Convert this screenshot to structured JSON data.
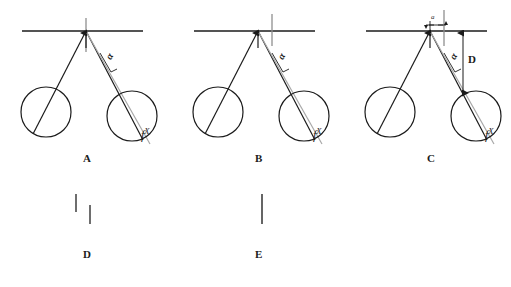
{
  "figure": {
    "background_color": "#ffffff",
    "stroke_color": "#1b1b1b",
    "gray_stroke_color": "#9a9a9a",
    "panels": [
      {
        "id": "A",
        "label": "A",
        "label_x": 86,
        "label_y": 158,
        "origin_x": 0,
        "bar": {
          "x1": 22,
          "x2": 143,
          "y": 31
        },
        "pivot": {
          "x": 86,
          "y": 31
        },
        "vertical_ref": {
          "x": 86,
          "y_top": 18,
          "y_bottom": 52
        },
        "pivot_arrow": {
          "x": 86,
          "y_tail": 48,
          "y_head": 33
        },
        "left_bob": {
          "cx": 46,
          "cy": 112,
          "r": 25
        },
        "right_bob": {
          "cx": 132,
          "cy": 116,
          "r": 25
        },
        "left_string": {
          "x1": 86,
          "y1": 31,
          "x2": 33,
          "y2": 134
        },
        "right_string_black": {
          "x1": 86,
          "y1": 31,
          "x2": 143,
          "y2": 140
        },
        "right_string_gray": {
          "x1": 86,
          "y1": 32,
          "x2": 150,
          "y2": 144
        },
        "alpha": {
          "x": 104,
          "y": 57,
          "text": "α",
          "rotation": -62
        },
        "alpha_bracket": [
          {
            "x1": 100,
            "y1": 53,
            "x2": 111,
            "y2": 72
          },
          {
            "x1": 111,
            "y1": 72,
            "x2": 117,
            "y2": 69
          }
        ],
        "fx": {
          "x": 141,
          "y": 130,
          "base": "f",
          "sup": "X"
        },
        "has_d_dimension": false,
        "has_a_dimension": false
      },
      {
        "id": "B",
        "label": "B",
        "label_x": 258,
        "label_y": 158,
        "origin_x": 172,
        "bar": {
          "x1": 194,
          "x2": 315,
          "y": 31
        },
        "pivot": {
          "x": 258,
          "y": 31
        },
        "vertical_ref": {
          "x": 272,
          "y_top": 18,
          "y_bottom": 46
        },
        "pivot_arrow": {
          "x": 258,
          "y_tail": 48,
          "y_head": 33
        },
        "left_bob": {
          "cx": 218,
          "cy": 112,
          "r": 25
        },
        "right_bob": {
          "cx": 304,
          "cy": 116,
          "r": 25
        },
        "left_string": {
          "x1": 258,
          "y1": 31,
          "x2": 205,
          "y2": 134
        },
        "right_string_black": {
          "x1": 258,
          "y1": 31,
          "x2": 315,
          "y2": 140
        },
        "right_string_gray": {
          "x1": 258,
          "y1": 32,
          "x2": 322,
          "y2": 144
        },
        "alpha": {
          "x": 276,
          "y": 57,
          "text": "α",
          "rotation": -62
        },
        "alpha_bracket": [
          {
            "x1": 272,
            "y1": 53,
            "x2": 283,
            "y2": 72
          },
          {
            "x1": 283,
            "y1": 72,
            "x2": 289,
            "y2": 69
          }
        ],
        "fx": {
          "x": 313,
          "y": 130,
          "base": "f",
          "sup": "X"
        },
        "has_d_dimension": false,
        "has_a_dimension": false
      },
      {
        "id": "C",
        "label": "C",
        "label_x": 430,
        "label_y": 158,
        "origin_x": 344,
        "bar": {
          "x1": 366,
          "x2": 487,
          "y": 31
        },
        "pivot": {
          "x": 430,
          "y": 31
        },
        "vertical_ref": {
          "x": 444,
          "y_top": 14,
          "y_bottom": 46
        },
        "pivot_arrow": {
          "x": 430,
          "y_tail": 48,
          "y_head": 33
        },
        "left_bob": {
          "cx": 390,
          "cy": 112,
          "r": 25
        },
        "right_bob": {
          "cx": 476,
          "cy": 116,
          "r": 25
        },
        "left_string": {
          "x1": 430,
          "y1": 31,
          "x2": 377,
          "y2": 134
        },
        "right_string_black": {
          "x1": 430,
          "y1": 31,
          "x2": 487,
          "y2": 140
        },
        "right_string_gray": {
          "x1": 430,
          "y1": 32,
          "x2": 494,
          "y2": 144
        },
        "alpha": {
          "x": 448,
          "y": 57,
          "text": "α",
          "rotation": -62
        },
        "alpha_bracket": [
          {
            "x1": 444,
            "y1": 53,
            "x2": 455,
            "y2": 72
          },
          {
            "x1": 455,
            "y1": 72,
            "x2": 461,
            "y2": 69
          }
        ],
        "fx": {
          "x": 485,
          "y": 130,
          "base": "f",
          "sup": "X"
        },
        "has_d_dimension": true,
        "has_a_dimension": true,
        "d_dimension": {
          "label": "D",
          "label_x": 472,
          "label_y": 60,
          "x": 463,
          "y_top": 32,
          "y_bottom": 93
        },
        "a_dimension": {
          "label": "a",
          "label_x": 432,
          "label_y": 14,
          "x_left": 425,
          "x_right": 444,
          "y": 25
        }
      },
      {
        "id": "D",
        "label": "D",
        "label_x": 86,
        "label_y": 254,
        "origin_x": 0,
        "marks": [
          {
            "x": 76,
            "y1": 194,
            "y2": 212
          },
          {
            "x": 90,
            "y1": 205,
            "y2": 224
          }
        ]
      },
      {
        "id": "E",
        "label": "E",
        "label_x": 258,
        "label_y": 254,
        "origin_x": 172,
        "marks": [
          {
            "x": 262,
            "y1": 194,
            "y2": 224
          }
        ]
      }
    ]
  }
}
